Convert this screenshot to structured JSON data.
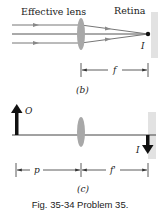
{
  "figure": {
    "caption": "Fig. 35-34  Problem 35.",
    "colors": {
      "line": "#555555",
      "lens": "#a8a8a8",
      "retina": "#e0e0e0",
      "arrow": "#111111"
    },
    "panel_b": {
      "label": "(b)",
      "lens_label": "Effective lens",
      "retina_label": "Retina",
      "image_label": "I",
      "distance_label": "f"
    },
    "panel_c": {
      "label": "(c)",
      "object_label": "O",
      "image_label": "I",
      "object_distance_label": "p",
      "image_distance_label": "f'"
    }
  }
}
